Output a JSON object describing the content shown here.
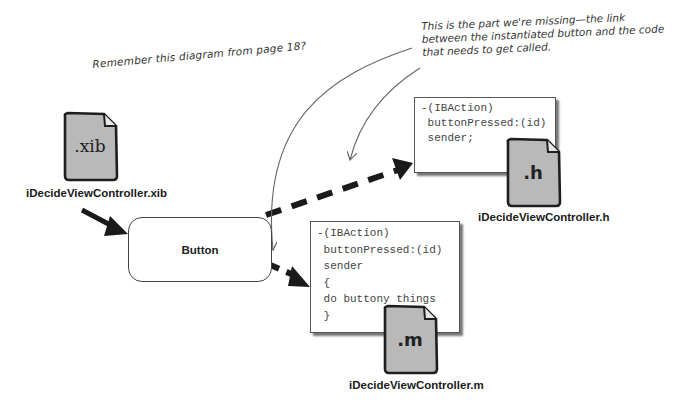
{
  "annotations": {
    "remember_note": "Remember this diagram from page 18?",
    "missing_note_lines": [
      "This is the part we're missing—the link",
      "between the instantiated button and the code",
      "that needs to get called."
    ]
  },
  "files": {
    "xib": {
      "ext": ".xib",
      "name": "iDecideViewController.xib",
      "icon": "document-icon"
    },
    "h": {
      "ext": ".h",
      "name": "iDecideViewController.h",
      "icon": "document-icon"
    },
    "m": {
      "ext": ".m",
      "name": "iDecideViewController.m",
      "icon": "document-icon"
    }
  },
  "button_node": {
    "label": "Button"
  },
  "code_h": {
    "lines": [
      "-(IBAction)",
      " buttonPressed:(id)",
      " sender;"
    ]
  },
  "code_m": {
    "lines": [
      "-(IBAction)",
      " buttonPressed:(id)",
      " sender",
      " {",
      " do buttony things",
      " }"
    ]
  },
  "colors": {
    "background": "#ffffff",
    "file_fill": "#b8b8b8",
    "stroke": "#222222",
    "arrow": "#1a1a1a",
    "thin_arrow": "#666666"
  }
}
